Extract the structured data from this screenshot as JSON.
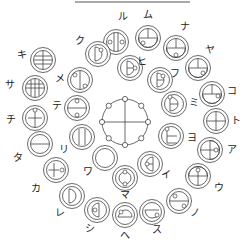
{
  "diagram": {
    "title_line": {
      "x1": 75,
      "x2": 190,
      "y": 2
    },
    "center": {
      "x": 125,
      "y": 122,
      "r": 23,
      "nodes": 8
    },
    "glyphs": [
      {
        "id": "ru",
        "label": "ル",
        "cx": 116,
        "cy": 42,
        "lx": 123,
        "ly": 17,
        "pattern": "two-vbars-dots-lr"
      },
      {
        "id": "mu",
        "label": "ム",
        "cx": 148,
        "cy": 38,
        "lx": 148,
        "ly": 15,
        "pattern": "bowl-cross-dot-bl"
      },
      {
        "id": "na",
        "label": "ナ",
        "cx": 176,
        "cy": 48,
        "lx": 185,
        "ly": 27,
        "pattern": "bowl-cross-dot-b"
      },
      {
        "id": "ya",
        "label": "ヤ",
        "cx": 198,
        "cy": 68,
        "lx": 210,
        "ly": 50,
        "pattern": "bowl-cross-dot-br"
      },
      {
        "id": "ko",
        "label": "コ",
        "cx": 212,
        "cy": 94,
        "lx": 232,
        "ly": 91,
        "pattern": "bowl-cross-dot-r"
      },
      {
        "id": "to",
        "label": "ト",
        "cx": 216,
        "cy": 121,
        "lx": 236,
        "ly": 121,
        "pattern": "cross"
      },
      {
        "id": "a",
        "label": "ア",
        "cx": 210,
        "cy": 150,
        "lx": 232,
        "ly": 150,
        "pattern": "cross-d-dot-r"
      },
      {
        "id": "u",
        "label": "ウ",
        "cx": 198,
        "cy": 176,
        "lx": 219,
        "ly": 188,
        "pattern": "umbrella-dot-t"
      },
      {
        "id": "no",
        "label": "ノ",
        "cx": 179,
        "cy": 201,
        "lx": 195,
        "ly": 213,
        "pattern": "hbar-dots-tl-br"
      },
      {
        "id": "su",
        "label": "ス",
        "cx": 152,
        "cy": 212,
        "lx": 157,
        "ly": 230,
        "pattern": "bowl-dot-br"
      },
      {
        "id": "he",
        "label": "ヘ",
        "cx": 125,
        "cy": 215,
        "lx": 125,
        "ly": 236,
        "pattern": "dome-dot-tl"
      },
      {
        "id": "shi",
        "label": "シ",
        "cx": 97,
        "cy": 210,
        "lx": 90,
        "ly": 229,
        "pattern": "half-d-left-dot-l"
      },
      {
        "id": "re",
        "label": "レ",
        "cx": 72,
        "cy": 196,
        "lx": 60,
        "ly": 213,
        "pattern": "d-right"
      },
      {
        "id": "ka",
        "label": "カ",
        "cx": 56,
        "cy": 170,
        "lx": 36,
        "ly": 189,
        "pattern": "cross-dot-r"
      },
      {
        "id": "ta",
        "label": "タ",
        "cx": 40,
        "cy": 144,
        "lx": 18,
        "ly": 158,
        "pattern": "hbar"
      },
      {
        "id": "chi",
        "label": "チ",
        "cx": 35,
        "cy": 118,
        "lx": 11,
        "ly": 120,
        "pattern": "cross-dot-t"
      },
      {
        "id": "sa",
        "label": "サ",
        "cx": 35,
        "cy": 88,
        "lx": 10,
        "ly": 85,
        "pattern": "grid"
      },
      {
        "id": "ki",
        "label": "キ",
        "cx": 43,
        "cy": 60,
        "lx": 22,
        "ly": 55,
        "pattern": "grid-top"
      },
      {
        "id": "ku",
        "label": "ク",
        "cx": 98,
        "cy": 54,
        "lx": 80,
        "ly": 41,
        "pattern": "d-right-dot-tr"
      },
      {
        "id": "me",
        "label": "メ",
        "cx": 80,
        "cy": 80,
        "lx": 60,
        "ly": 79,
        "pattern": "vbar-dots-tl-br"
      },
      {
        "id": "te",
        "label": "テ",
        "cx": 77,
        "cy": 108,
        "lx": 57,
        "ly": 106,
        "pattern": "hbar-dots-tb"
      },
      {
        "id": "ri",
        "label": "リ",
        "cx": 82,
        "cy": 137,
        "lx": 64,
        "ly": 150,
        "pattern": "two-vbars"
      },
      {
        "id": "wa",
        "label": "ワ",
        "cx": 105,
        "cy": 158,
        "lx": 88,
        "ly": 172,
        "pattern": "ring"
      },
      {
        "id": "ma",
        "label": "マ",
        "cx": 125,
        "cy": 178,
        "lx": 125,
        "ly": 195,
        "pattern": "ring-dots-tb"
      },
      {
        "id": "i",
        "label": "イ",
        "cx": 150,
        "cy": 164,
        "lx": 166,
        "ly": 175,
        "pattern": "half-d-left-hbar-dot-l"
      },
      {
        "id": "yo",
        "label": "ヨ",
        "cx": 171,
        "cy": 136,
        "lx": 192,
        "ly": 138,
        "pattern": "half-box-dot-t"
      },
      {
        "id": "mi",
        "label": "ミ",
        "cx": 174,
        "cy": 104,
        "lx": 194,
        "ly": 103,
        "pattern": "d-right-hbar-dot-tl"
      },
      {
        "id": "fu",
        "label": "フ",
        "cx": 160,
        "cy": 80,
        "lx": 175,
        "ly": 74,
        "pattern": "d-right-dot-tr-b"
      },
      {
        "id": "hi",
        "label": "ヒ",
        "cx": 130,
        "cy": 68,
        "lx": 142,
        "ly": 62,
        "pattern": "d-right-hbar-dot-r"
      }
    ]
  }
}
